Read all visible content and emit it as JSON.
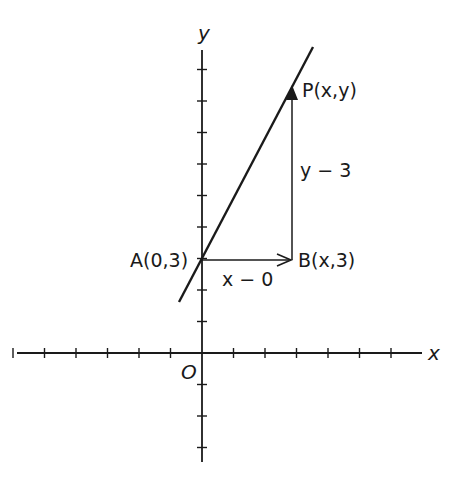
{
  "figure": {
    "axes": {
      "x_label": "x",
      "y_label": "y",
      "origin_label": "O",
      "origin_px": [
        202,
        353
      ],
      "tick_spacing_px": 31.5,
      "x_ticks_left": 6,
      "x_ticks_right": 6,
      "y_ticks_up": 9,
      "y_ticks_down": 3
    },
    "line": {
      "from": [
        179,
        302
      ],
      "to": [
        313,
        47
      ]
    },
    "points": {
      "A": {
        "label": "A(0,3)",
        "px": [
          202,
          260
        ]
      },
      "B": {
        "label": "B(x,3)",
        "px": [
          292,
          260
        ]
      },
      "P": {
        "label": "P(x,y)",
        "px": [
          292,
          88
        ]
      }
    },
    "segments": {
      "horizontal_label": "x − 0",
      "vertical_label": "y − 3"
    },
    "colors": {
      "ink": "#1a1a1a",
      "background": "#ffffff"
    }
  }
}
